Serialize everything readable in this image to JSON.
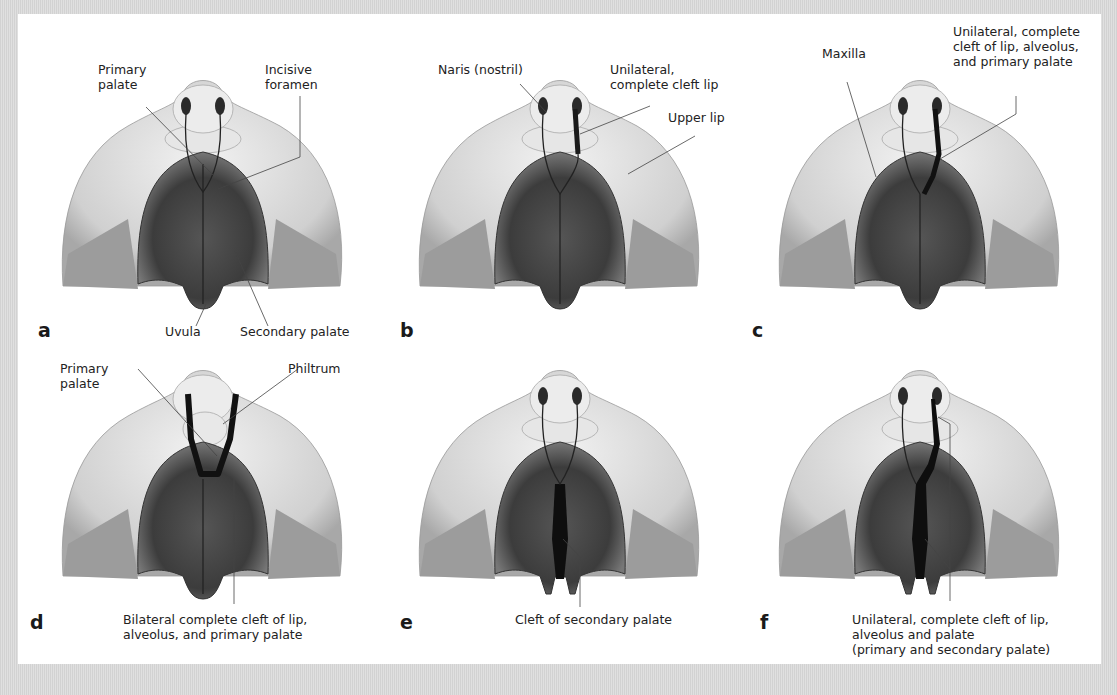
{
  "figure": {
    "background_color": "#d9d9d9",
    "panel_color": "#ffffff",
    "panels": [
      {
        "letter": "a",
        "variant": "normal",
        "labels": [
          {
            "id": "primary_palate",
            "text": "Primary\npalate"
          },
          {
            "id": "incisive_foramen",
            "text": "Incisive\nforamen"
          },
          {
            "id": "uvula",
            "text": "Uvula"
          },
          {
            "id": "secondary_palate",
            "text": "Secondary palate"
          }
        ]
      },
      {
        "letter": "b",
        "variant": "unilateral-cleft-lip",
        "labels": [
          {
            "id": "naris",
            "text": "Naris (nostril)"
          },
          {
            "id": "unilateral_cleft_lip",
            "text": "Unilateral,\ncomplete cleft lip"
          },
          {
            "id": "upper_lip",
            "text": "Upper lip"
          }
        ]
      },
      {
        "letter": "c",
        "variant": "unilateral-cleft-lip-alveolus-primary",
        "labels": [
          {
            "id": "maxilla",
            "text": "Maxilla"
          },
          {
            "id": "unilateral_cleft_lip_alveolus",
            "text": "Unilateral, complete\ncleft of lip, alveolus,\nand primary palate"
          }
        ]
      },
      {
        "letter": "d",
        "variant": "bilateral-cleft",
        "labels": [
          {
            "id": "primary_palate",
            "text": "Primary\npalate"
          },
          {
            "id": "philtrum",
            "text": "Philtrum"
          },
          {
            "id": "bilateral_cleft",
            "text": "Bilateral complete cleft of lip,\nalveolus, and primary palate"
          }
        ]
      },
      {
        "letter": "e",
        "variant": "cleft-secondary-palate",
        "labels": [
          {
            "id": "cleft_secondary",
            "text": "Cleft  of secondary palate"
          }
        ]
      },
      {
        "letter": "f",
        "variant": "unilateral-complete-cleft",
        "labels": [
          {
            "id": "unilateral_complete_cleft",
            "text": "Unilateral, complete cleft of lip,\nalveolus and palate\n(primary and secondary palate)"
          }
        ]
      }
    ]
  }
}
